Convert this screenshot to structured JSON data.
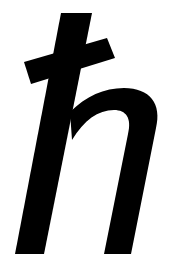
{
  "symbol": {
    "character": "ħ",
    "name": "h-bar (reduced Planck constant)",
    "color": "#000000",
    "background": "#ffffff"
  }
}
